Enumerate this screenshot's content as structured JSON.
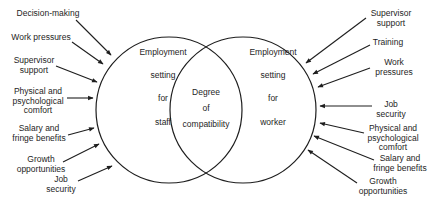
{
  "diagram": {
    "left_circle": {
      "lines": [
        "Employment",
        "setting",
        "for",
        "staff"
      ]
    },
    "right_circle": {
      "lines": [
        "Employment",
        "setting",
        "for",
        "worker"
      ]
    },
    "overlap": {
      "lines": [
        "Degree",
        "of",
        "compatibility"
      ]
    },
    "left_factors": [
      {
        "lines": [
          "Decision-making"
        ]
      },
      {
        "lines": [
          "Work  pressures"
        ]
      },
      {
        "lines": [
          "Supervisor",
          "support"
        ]
      },
      {
        "lines": [
          "Physical  and",
          "psychological",
          "comfort"
        ]
      },
      {
        "lines": [
          "Salary  and",
          "fringe  benefits"
        ]
      },
      {
        "lines": [
          "Growth",
          "opportunities"
        ]
      },
      {
        "lines": [
          "Job",
          "security"
        ]
      }
    ],
    "right_factors": [
      {
        "lines": [
          "Supervisor",
          "support"
        ]
      },
      {
        "lines": [
          "Training"
        ]
      },
      {
        "lines": [
          "Work",
          "pressures"
        ]
      },
      {
        "lines": [
          "Job",
          "security"
        ]
      },
      {
        "lines": [
          "Physical  and",
          "psychological",
          "comfort"
        ]
      },
      {
        "lines": [
          "Salary  and",
          "fringe  benefits"
        ]
      },
      {
        "lines": [
          "Growth",
          "opportunities"
        ]
      }
    ],
    "colors": {
      "stroke": "#1e1e1e",
      "background": "#ffffff"
    }
  }
}
